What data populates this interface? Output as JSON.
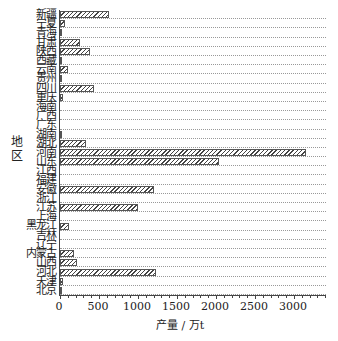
{
  "chart_data": {
    "type": "bar",
    "orientation": "horizontal",
    "title": "",
    "xlabel": "产量 / 万t",
    "ylabel": "地区",
    "xlim": [
      0,
      3400
    ],
    "xticks": [
      0,
      500,
      1000,
      1500,
      2000,
      2500,
      3000
    ],
    "grid": "horizontal dotted",
    "legend": null,
    "categories": [
      "北京",
      "天津",
      "河北",
      "山西",
      "内蒙古",
      "辽宁",
      "吉林",
      "黑龙江",
      "上海",
      "江苏",
      "浙江",
      "安徽",
      "福建",
      "江西",
      "山东",
      "河南",
      "湖北",
      "湖南",
      "广东",
      "广西",
      "海南",
      "重庆",
      "四川",
      "贵州",
      "云南",
      "西藏",
      "陕西",
      "甘肃",
      "青海",
      "宁夏",
      "新疆"
    ],
    "values": [
      10,
      40,
      1230,
      220,
      180,
      0,
      0,
      110,
      0,
      1000,
      0,
      1200,
      0,
      0,
      2040,
      3150,
      330,
      5,
      0,
      0,
      0,
      40,
      430,
      30,
      100,
      10,
      380,
      250,
      30,
      70,
      630
    ]
  },
  "axis": {
    "ytitle": "地区",
    "xtitle": "产量 / 万t",
    "xtick_labels": [
      "0",
      "500",
      "1000",
      "1500",
      "2000",
      "2500",
      "3000"
    ]
  }
}
